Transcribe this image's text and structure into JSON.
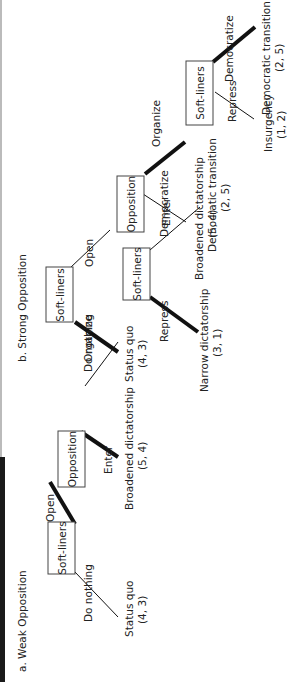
{
  "colors": {
    "line": "#111111",
    "box_border": "#444444",
    "text": "#222222",
    "edge_bar": "#1a1a1a"
  },
  "panel_a": {
    "title": "a. Weak Opposition",
    "nodes": {
      "n1": "Soft-liners",
      "n2": "Opposition",
      "n3": "Soft-liners"
    },
    "moves": {
      "do_nothing": "Do nothing",
      "open": "Open",
      "enter": "Enter",
      "organize": "Organize",
      "repress": "Repress",
      "democratize": "Democratize"
    },
    "outcomes": {
      "status_quo": {
        "label": "Status quo",
        "payoff": "(4, 3)"
      },
      "broadened": {
        "label": "Broadened dictatorship",
        "payoff": "(5, 4)"
      },
      "narrow": {
        "label": "Narrow dictatorship",
        "payoff": "(3, 1)"
      },
      "democratic": {
        "label": "Democratic transition",
        "payoff": "(2, 5)"
      }
    }
  },
  "panel_b": {
    "title": "b. Strong Opposition",
    "nodes": {
      "n1": "Soft-liners",
      "n2": "Opposition",
      "n3": "Soft-liners"
    },
    "moves": {
      "do_nothing": "Do nothing",
      "open": "Open",
      "enter": "Enter",
      "organize": "Organize",
      "repress": "Repress",
      "democratize": "Democratize"
    },
    "outcomes": {
      "status_quo": {
        "label": "Status quo",
        "payoff": "(4, 3)"
      },
      "broadened": {
        "label": "Broadened dictatorship",
        "payoff": "(5, 4)"
      },
      "insurgency": {
        "label": "Insurgency",
        "payoff": "(1, 2)"
      },
      "democratic": {
        "label": "Democratic transition",
        "payoff": "(2, 5)"
      }
    }
  }
}
